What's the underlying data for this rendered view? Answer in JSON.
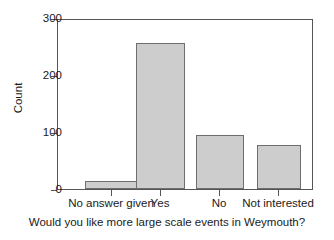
{
  "chart_data": {
    "type": "bar",
    "title": "",
    "subtitle": "",
    "xlabel": "Would you like more large scale events in Weymouth?",
    "ylabel": "Count",
    "categories": [
      "No answer given",
      "Yes",
      "No",
      "Not interested"
    ],
    "values": [
      14,
      260,
      96,
      79
    ],
    "series": [
      {
        "name": "Count",
        "values": [
          14,
          260,
          96,
          79
        ]
      }
    ],
    "ylim": [
      0,
      300
    ],
    "yticks": [
      0,
      100,
      200,
      300
    ],
    "ytick_labels": [
      "0",
      "100",
      "200",
      "300"
    ],
    "grid": false,
    "legend": false,
    "legend_position": "none",
    "bar_fill_color": "#cdcdcd",
    "bar_edge_color": "#6e6e6e",
    "axis_color": "#555555",
    "background_color": "#ffffff",
    "frame": "box"
  },
  "axes": {
    "y_title": "Count",
    "x_title": "Would you like more large scale events in Weymouth?"
  }
}
